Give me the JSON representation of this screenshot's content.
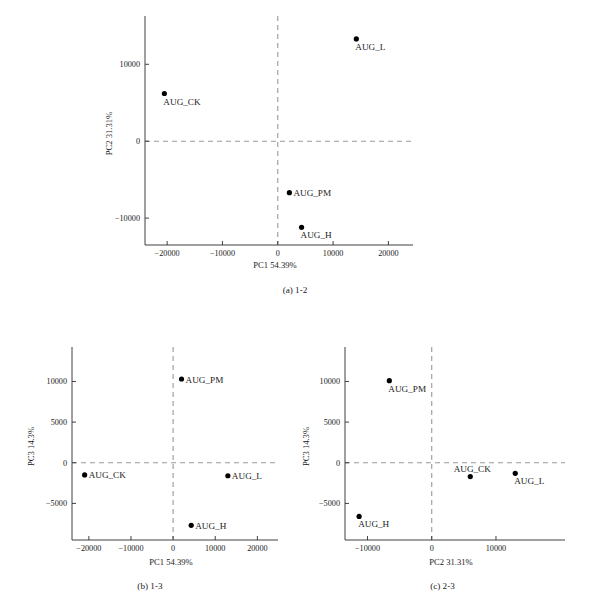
{
  "figure": {
    "background": "#ffffff",
    "point_color": "#000000",
    "axis_color": "#2b2b2b",
    "dash_color": "#9a9a9a"
  },
  "panels": [
    {
      "key": "a",
      "caption": "(a) 1-2",
      "xlabel": "PC1 54.39%",
      "ylabel": "PC2 31.31%",
      "xticks": [
        "-20000",
        "-10000",
        "0",
        "10000",
        "20000"
      ],
      "yticks": [
        "10000",
        "0",
        "-10000"
      ],
      "labels": [
        "AUG_CK",
        "AUG_L",
        "AUG_PM",
        "AUG_H"
      ]
    },
    {
      "key": "b",
      "caption": "(b) 1-3",
      "xlabel": "PC1  54.39%",
      "ylabel": "PC3  14.3%",
      "xticks": [
        "-20000",
        "-10000",
        "0",
        "10000",
        "20000"
      ],
      "yticks": [
        "10000",
        "5000",
        "0",
        "-5000"
      ],
      "labels": [
        "AUG_PM",
        "AUG_CK",
        "AUG_L",
        "AUG_H"
      ]
    },
    {
      "key": "c",
      "caption": "(c) 2-3",
      "xlabel": "PC2  31.31%",
      "ylabel": "PC3  14.3%",
      "xticks": [
        "-10000",
        "0",
        "10000"
      ],
      "yticks": [
        "10000",
        "5000",
        "0",
        "-5000"
      ],
      "labels": [
        "AUG_PM",
        "AUG_CK",
        "AUG_L",
        "AUG_H"
      ]
    }
  ],
  "chart_data": [
    {
      "type": "scatter",
      "panel": "a",
      "title": "(a) 1-2",
      "xlabel": "PC1 54.39%",
      "ylabel": "PC2 31.31%",
      "xlim": [
        -24000,
        23000
      ],
      "ylim": [
        -13500,
        15500
      ],
      "xticks": [
        -20000,
        -10000,
        0,
        10000,
        20000
      ],
      "yticks": [
        10000,
        0,
        -10000
      ],
      "grid": false,
      "legend": "none",
      "reference_lines": {
        "x": 0,
        "y": 0,
        "style": "dashed"
      },
      "points": [
        {
          "label": "AUG_CK",
          "x": -20500,
          "y": 6200,
          "label_pos": "below-right"
        },
        {
          "label": "AUG_L",
          "x": 14200,
          "y": 13300,
          "label_pos": "below-right"
        },
        {
          "label": "AUG_PM",
          "x": 2100,
          "y": -6700,
          "label_pos": "right"
        },
        {
          "label": "AUG_H",
          "x": 4300,
          "y": -11200,
          "label_pos": "below-right"
        }
      ]
    },
    {
      "type": "scatter",
      "panel": "b",
      "title": "(b) 1-3",
      "xlabel": "PC1  54.39%",
      "ylabel": "PC3  14.3%",
      "xlim": [
        -24000,
        23000
      ],
      "ylim": [
        -9500,
        13500
      ],
      "xticks": [
        -20000,
        -10000,
        0,
        10000,
        20000
      ],
      "yticks": [
        10000,
        5000,
        0,
        -5000
      ],
      "grid": false,
      "legend": "none",
      "reference_lines": {
        "x": 0,
        "y": 0,
        "style": "dashed"
      },
      "points": [
        {
          "label": "AUG_PM",
          "x": 2000,
          "y": 10300,
          "label_pos": "right"
        },
        {
          "label": "AUG_CK",
          "x": -21000,
          "y": -1500,
          "label_pos": "right"
        },
        {
          "label": "AUG_L",
          "x": 13000,
          "y": -1600,
          "label_pos": "right"
        },
        {
          "label": "AUG_H",
          "x": 4300,
          "y": -7700,
          "label_pos": "right"
        }
      ]
    },
    {
      "type": "scatter",
      "panel": "c",
      "title": "(c) 2-3",
      "xlabel": "PC2  31.31%",
      "ylabel": "PC3  14.3%",
      "xlim": [
        -13500,
        19500
      ],
      "ylim": [
        -9500,
        13500
      ],
      "xticks": [
        -10000,
        0,
        10000
      ],
      "yticks": [
        10000,
        5000,
        0,
        -5000
      ],
      "grid": false,
      "legend": "none",
      "reference_lines": {
        "x": 0,
        "y": 0,
        "style": "dashed"
      },
      "points": [
        {
          "label": "AUG_PM",
          "x": -6600,
          "y": 10100,
          "label_pos": "below"
        },
        {
          "label": "AUG_CK",
          "x": 6000,
          "y": -1700,
          "label_pos": "above"
        },
        {
          "label": "AUG_L",
          "x": 13000,
          "y": -1300,
          "label_pos": "below"
        },
        {
          "label": "AUG_H",
          "x": -11300,
          "y": -6600,
          "label_pos": "below"
        }
      ]
    }
  ]
}
